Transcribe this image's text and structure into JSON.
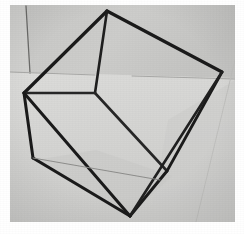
{
  "image": {
    "kind": "photograph",
    "subject": "wireframe-cube",
    "description": "Black-and-white photograph of a skeletal wireframe cube made of thin dark rods resting on a pale gray surface",
    "width": 244,
    "height": 234,
    "border": {
      "color": "#ffffff",
      "left": 10,
      "top": 5,
      "right": 9,
      "bottom": 12
    }
  },
  "colors": {
    "paper_white": "#ffffff",
    "surface_light": "#d9d9d7",
    "surface_mid": "#cfcfcd",
    "surface_upper": "#c9c9c7",
    "surface_shadow": "#c2c2c0",
    "surface_floor": "#d4d4d2",
    "rod_black": "#1a1a1a",
    "rod_soft": "#3a3a3a",
    "faint_line": "#9a9a98",
    "wall_edge": "#6b6b69"
  },
  "photo_area": {
    "x": 10,
    "y": 5,
    "width": 225,
    "height": 217
  },
  "background_regions": [
    {
      "name": "upper-wall-panel",
      "fill": "#c9c9c7",
      "points": "10,5 235,5 235,78 10,72"
    },
    {
      "name": "left-wall-panel",
      "fill": "#cfcfcd",
      "points": "10,5 27,5 31,72 10,72"
    },
    {
      "name": "floor-surface",
      "fill": "#d6d6d4",
      "points": "10,72 235,78 235,222 10,222"
    }
  ],
  "background_lines": [
    {
      "name": "wall-corner-edge",
      "x1": 26,
      "y1": 6,
      "x2": 30,
      "y2": 73,
      "width": 1.3,
      "color": "#6b6b69"
    },
    {
      "name": "wall-floor-horizon-left",
      "x1": 10,
      "y1": 72,
      "x2": 95,
      "y2": 75,
      "width": 1.0,
      "color": "#a8a8a6"
    },
    {
      "name": "wall-floor-horizon-right",
      "x1": 132,
      "y1": 76,
      "x2": 235,
      "y2": 79,
      "width": 1.0,
      "color": "#a8a8a6"
    },
    {
      "name": "floor-seam-right",
      "x1": 235,
      "y1": 60,
      "x2": 196,
      "y2": 222,
      "width": 1.0,
      "color": "#c0c0be"
    }
  ],
  "cube": {
    "label": "wireframe-cube",
    "vertices": {
      "top_back": {
        "name": "top-vertex",
        "x": 107,
        "y": 11
      },
      "right_back": {
        "name": "right-vertex",
        "x": 222,
        "y": 72
      },
      "left_back": {
        "name": "left-vertex",
        "x": 24,
        "y": 93
      },
      "center_back": {
        "name": "inner-back-vertex",
        "x": 95,
        "y": 93
      },
      "left_front": {
        "name": "lower-left-vertex",
        "x": 33,
        "y": 158
      },
      "bottom_front": {
        "name": "bottom-vertex",
        "x": 130,
        "y": 216
      },
      "right_front": {
        "name": "right-lower-vertex",
        "x": 167,
        "y": 171
      },
      "center_front": {
        "name": "inner-front-vertex",
        "x": 160,
        "y": 180
      }
    },
    "edges": [
      {
        "name": "edge-top-left",
        "from": "top_back",
        "to": "left_back",
        "width": 3.2,
        "color": "#1a1a1a"
      },
      {
        "name": "edge-top-right",
        "from": "top_back",
        "to": "right_back",
        "width": 3.2,
        "color": "#1a1a1a"
      },
      {
        "name": "edge-top-center",
        "from": "top_back",
        "to": "center_back",
        "width": 2.6,
        "color": "#1e1e1e"
      },
      {
        "name": "edge-center-left",
        "from": "center_back",
        "to": "left_back",
        "width": 2.6,
        "color": "#262626"
      },
      {
        "name": "edge-center-right",
        "from": "center_back",
        "to": "right_front",
        "width": 2.6,
        "color": "#262626"
      },
      {
        "name": "edge-left-down",
        "from": "left_back",
        "to": "left_front",
        "width": 3.0,
        "color": "#1a1a1a"
      },
      {
        "name": "edge-left-bottom",
        "from": "left_front",
        "to": "bottom_front",
        "width": 3.2,
        "color": "#1a1a1a"
      },
      {
        "name": "edge-bottom-right",
        "from": "bottom_front",
        "to": "right_front",
        "width": 3.0,
        "color": "#1a1a1a"
      },
      {
        "name": "edge-right-vertical",
        "from": "right_back",
        "to": "right_front",
        "width": 2.8,
        "color": "#1a1a1a"
      },
      {
        "name": "edge-right-diagonal",
        "from": "right_back",
        "to": "bottom_front",
        "width": 2.6,
        "color": "#202020"
      },
      {
        "name": "edge-left-long-diag",
        "from": "left_back",
        "to": "bottom_front",
        "width": 3.0,
        "color": "#1a1a1a"
      },
      {
        "name": "edge-faint-far-base",
        "from": "left_front",
        "to": "center_front",
        "width": 1.0,
        "color": "#8e8e8c"
      }
    ]
  },
  "shadows": [
    {
      "name": "cube-cast-shadow",
      "fill": "#c8c8c6",
      "opacity": 0.55,
      "points": "36,160 132,214 172,176 96,150"
    },
    {
      "name": "right-floor-shade",
      "fill": "#cdcdcb",
      "opacity": 0.6,
      "points": "168,120 235,80 235,222 150,222"
    }
  ]
}
